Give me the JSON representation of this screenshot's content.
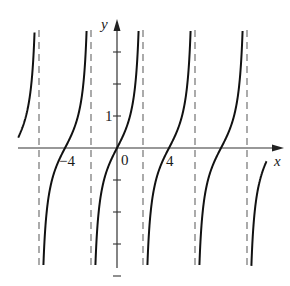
{
  "chart_data": {
    "type": "line",
    "title": "",
    "function": "y = tan(pi*x/4)",
    "xlabel": "x",
    "ylabel": "y",
    "x_tick_labels": [
      "-4",
      "0",
      "4"
    ],
    "y_tick_labels": [
      "1"
    ],
    "x_ticks": [
      -4,
      0,
      4
    ],
    "y_ticks": [
      -4,
      -3,
      -2,
      -1,
      1,
      2,
      3
    ],
    "period": 4,
    "zeros": [
      -4,
      0,
      4,
      8
    ],
    "vertical_asymptotes": [
      -6,
      -2,
      2,
      6,
      10
    ],
    "xlim": [
      -7.6,
      12.5
    ],
    "ylim": [
      -3.75,
      3.9
    ],
    "grid": false,
    "asymptote_style": "dashed",
    "series": [
      {
        "name": "branch-1",
        "x_range": [
          -7.6,
          -6.0
        ]
      },
      {
        "name": "branch-2",
        "x_range": [
          -6.0,
          -2.0
        ]
      },
      {
        "name": "branch-3",
        "x_range": [
          -2.0,
          2.0
        ]
      },
      {
        "name": "branch-4",
        "x_range": [
          2.0,
          6.0
        ]
      },
      {
        "name": "branch-5",
        "x_range": [
          6.0,
          10.0
        ]
      },
      {
        "name": "branch-6",
        "x_range": [
          10.0,
          11.5
        ]
      }
    ]
  },
  "axes": {
    "x_label": "x",
    "y_label": "y",
    "origin_label": "0",
    "x_tick_neg4": "−4",
    "x_tick_4": "4",
    "y_tick_1": "1"
  },
  "colors": {
    "curve": "#111111",
    "axis": "#333333",
    "asymptote": "#666666"
  }
}
